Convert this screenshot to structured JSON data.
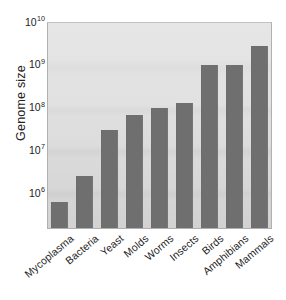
{
  "chart_data": {
    "type": "bar",
    "title": "",
    "subtitle": "",
    "xlabel": "",
    "ylabel": "Genome size",
    "yscale": "log",
    "ylim": [
      300000,
      10000000000
    ],
    "grid": false,
    "legend": null,
    "y_tick_labels": [
      {
        "mantissa": "10",
        "exponent": "10",
        "value": 10000000000
      },
      {
        "mantissa": "10",
        "exponent": "9",
        "value": 1000000000
      },
      {
        "mantissa": "10",
        "exponent": "8",
        "value": 100000000
      },
      {
        "mantissa": "10",
        "exponent": "7",
        "value": 10000000
      },
      {
        "mantissa": "10",
        "exponent": "6",
        "value": 1000000
      }
    ],
    "categories": [
      "Mycoplasma",
      "Bacteria",
      "Yeast",
      "Molds",
      "Worms",
      "Insects",
      "Birds",
      "Amphibians",
      "Mammals"
    ],
    "values": [
      600000,
      2500000,
      3000000,
      67000000,
      100000000,
      130000000,
      1000000000,
      1000000000,
      2700000000
    ],
    "series": [
      {
        "name": "Genome size",
        "values": [
          600000,
          2500000,
          30000000,
          67000000,
          100000000,
          130000000,
          1000000000,
          1000000000,
          2700000000
        ]
      }
    ]
  },
  "style": {
    "bar_color": "#6f6f6f",
    "plot_background_top": "#e6e6e6",
    "plot_background_bottom": "#d2d2d2",
    "axis_text_color": "#1d1d1d",
    "page_background": "#ffffff"
  }
}
